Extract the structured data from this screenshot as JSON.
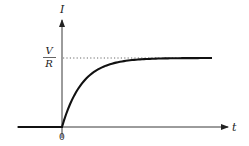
{
  "figure": {
    "y_axis_label": "I",
    "x_axis_label": "t",
    "origin_label": "0",
    "asymptote_label_numerator": "V",
    "asymptote_label_denominator": "R",
    "colors": {
      "curve": "#111111",
      "axis": "#222222",
      "asymptote": "#444444",
      "background": "#ffffff"
    }
  },
  "chart_data": {
    "type": "line",
    "title": "",
    "xlabel": "t",
    "ylabel": "I",
    "x_ticks": [
      "0"
    ],
    "y_ticks": [
      "V/R"
    ],
    "asymptote": {
      "label": "V/R",
      "value": 1.0,
      "style": "dotted"
    },
    "series": [
      {
        "name": "I(t)",
        "x": [
          -2.2,
          0,
          0.25,
          0.5,
          0.75,
          1,
          1.5,
          2,
          2.5,
          3,
          4,
          5,
          6,
          7.5
        ],
        "values": [
          0,
          0,
          0.22,
          0.39,
          0.53,
          0.63,
          0.78,
          0.86,
          0.92,
          0.95,
          0.98,
          0.99,
          1.0,
          1.0
        ]
      }
    ],
    "xlim": [
      -2.3,
      8.3
    ],
    "ylim": [
      0,
      1.4
    ],
    "grid": false,
    "legend": null
  }
}
